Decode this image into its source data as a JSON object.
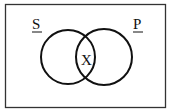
{
  "diagram": {
    "type": "venn",
    "sets": [
      {
        "label": "S",
        "position": "left"
      },
      {
        "label": "P",
        "position": "right"
      }
    ],
    "intersection_label": "X",
    "colors": {
      "stroke": "#111111",
      "background": "#ffffff",
      "frame": "#333333"
    }
  }
}
